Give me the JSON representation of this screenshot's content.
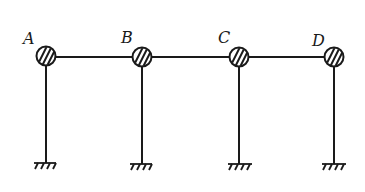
{
  "diagram": {
    "type": "structural-frame",
    "nodes": [
      {
        "label": "A",
        "x": 46,
        "y": 56
      },
      {
        "label": "B",
        "x": 142,
        "y": 57
      },
      {
        "label": "C",
        "x": 239,
        "y": 57
      },
      {
        "label": "D",
        "x": 334,
        "y": 57
      }
    ],
    "beam_y": 57,
    "support_y": 163,
    "line_color": "#1a1a1a"
  }
}
